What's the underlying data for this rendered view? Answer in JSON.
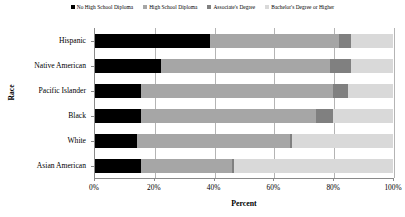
{
  "chart_data": {
    "type": "bar",
    "orientation": "horizontal",
    "stacked": true,
    "title": "",
    "xlabel": "Percent",
    "ylabel": "Race",
    "xlim": [
      0,
      100
    ],
    "xticks": [
      0,
      20,
      40,
      60,
      80,
      100
    ],
    "xtick_labels": [
      "0%",
      "20%",
      "40%",
      "60%",
      "80%",
      "100%"
    ],
    "grid": true,
    "grid_axis": "x",
    "legend_position": "top",
    "categories": [
      "Hispanic",
      "Native American",
      "Pacific Islander",
      "Black",
      "White",
      "Asian American"
    ],
    "series": [
      {
        "name": "No High School Diploma",
        "color": "#000000",
        "values": [
          38.5,
          22.0,
          15.5,
          15.5,
          14.0,
          15.5
        ]
      },
      {
        "name": "High School Diploma",
        "color": "#a6a6a6",
        "values": [
          43.5,
          57.0,
          64.5,
          58.5,
          51.5,
          30.5
        ]
      },
      {
        "name": "Associate's Degree",
        "color": "#808080",
        "values": [
          4.0,
          7.0,
          5.0,
          6.0,
          0.5,
          0.5
        ]
      },
      {
        "name": "Bachelor's Degree or Higher",
        "color": "#d9d9d9",
        "values": [
          14.0,
          14.0,
          15.0,
          20.0,
          34.0,
          53.5
        ]
      }
    ]
  },
  "legend": {
    "items": [
      {
        "label": "No High School Diploma",
        "color": "#000000"
      },
      {
        "label": "High School Diploma",
        "color": "#a6a6a6"
      },
      {
        "label": "Associate's Degree",
        "color": "#808080"
      },
      {
        "label": "Bachelor's Degree or Higher",
        "color": "#d9d9d9"
      }
    ]
  },
  "axes": {
    "y_title": "Race",
    "x_title": "Percent",
    "y_categories": [
      "Hispanic",
      "Native American",
      "Pacific Islander",
      "Black",
      "White",
      "Asian American"
    ],
    "x_tick_labels": [
      "0%",
      "20%",
      "40%",
      "60%",
      "80%",
      "100%"
    ]
  }
}
